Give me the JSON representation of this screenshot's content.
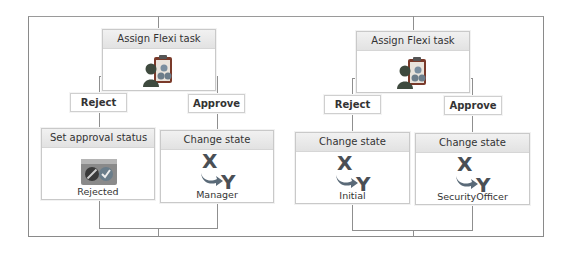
{
  "workflows": [
    {
      "assign_task": {
        "title": "Assign Flexi task",
        "icon": "assign-task-icon"
      },
      "branches": [
        {
          "label": "Reject",
          "node": {
            "title": "Set approval status",
            "icon": "approval-status-icon",
            "caption": "Rejected"
          }
        },
        {
          "label": "Approve",
          "node": {
            "title": "Change state",
            "icon": "change-state-xy-icon",
            "caption": "Manager"
          }
        }
      ]
    },
    {
      "assign_task": {
        "title": "Assign Flexi task",
        "icon": "assign-task-icon"
      },
      "branches": [
        {
          "label": "Reject",
          "node": {
            "title": "Change state",
            "icon": "change-state-xy-icon",
            "caption": "Initial"
          }
        },
        {
          "label": "Approve",
          "node": {
            "title": "Change state",
            "icon": "change-state-xy-icon",
            "caption": "SecurityOfficer"
          }
        }
      ]
    }
  ],
  "colors": {
    "connector": "#8f8f8f",
    "node_border": "#c9c9c9",
    "header_bg": "#e6e6e6",
    "xy_icon": "#4a4f55",
    "arrow_icon": "#5a6a78",
    "person_icon": "#3e4a3e",
    "clipboard_icon": "#7a3a2a",
    "status_icon_bg": "#6b6b6b"
  }
}
